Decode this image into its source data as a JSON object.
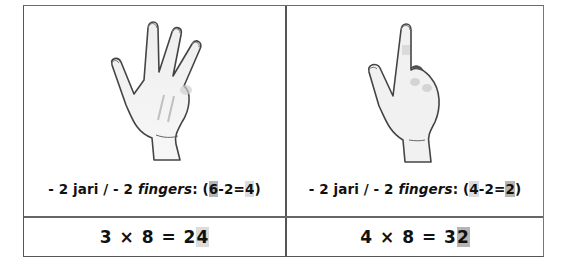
{
  "worksheet": {
    "cells": [
      {
        "illustration": "hand-showing-four-fingers",
        "caption": {
          "prefix": "- 2 jari / - 2 ",
          "italic": "fingers",
          "colon": ": ",
          "open": "(",
          "a": "6",
          "op": "-2=",
          "b": "4",
          "close": ")"
        },
        "equation": {
          "left": "3 × 8 = 2",
          "highlight": "4"
        }
      },
      {
        "illustration": "hand-showing-one-finger",
        "caption": {
          "prefix": "- 2 jari / - 2 ",
          "italic": "fingers",
          "colon": ": ",
          "open": "(",
          "a": "4",
          "op": "-2=",
          "b": "2",
          "close": ")"
        },
        "equation": {
          "left": "4 × 8 = 3",
          "highlight": "2"
        }
      }
    ],
    "colors": {
      "border": "#555555",
      "highlight_dark": "#b5b5b5",
      "highlight_light": "#dcdcdc",
      "text": "#111111"
    }
  }
}
